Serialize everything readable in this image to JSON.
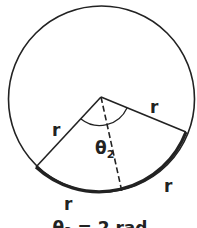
{
  "diagram": {
    "radius_label_left": "r",
    "radius_label_right": "r",
    "arc_label_bottom_left": "r",
    "arc_label_bottom_right": "r",
    "angle_label": "θ",
    "angle_subscript": "2",
    "caption": "θ₂ = 2 rad",
    "colors": {
      "stroke": "#222222",
      "background": "#ffffff"
    }
  }
}
